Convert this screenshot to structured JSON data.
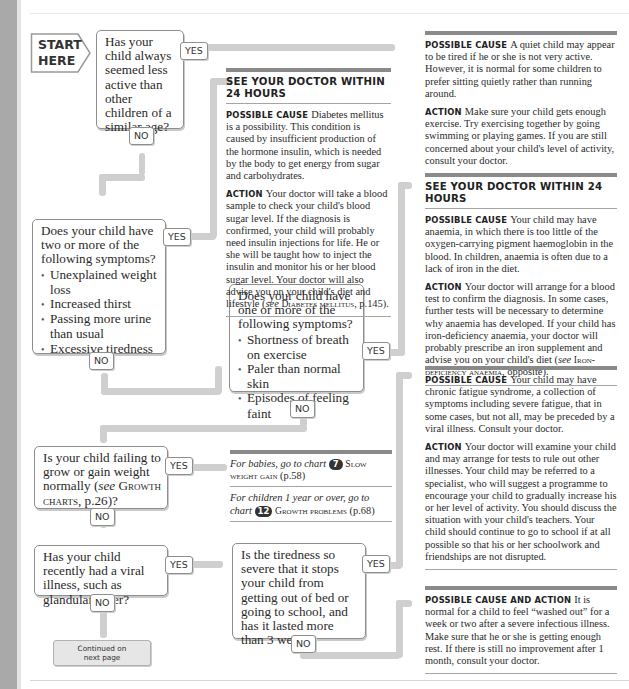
{
  "page": {
    "start_label_line1": "START",
    "start_label_line2": "HERE",
    "continued_line1": "Continued on",
    "continued_line2": "next page"
  },
  "questions": {
    "q1": {
      "text": "Has your child always seemed less active than other children of a similar age?",
      "yes": "YES",
      "no": "NO"
    },
    "q2": {
      "text": "Does your child have two or more of the following symptoms?",
      "bullets": [
        "Unexplained weight loss",
        "Increased thirst",
        "Passing more urine than usual",
        "Excessive tiredness"
      ],
      "yes": "YES",
      "no": "NO"
    },
    "q3": {
      "text": "Does your child have one or more of the following symptoms?",
      "bullets": [
        "Shortness of breath on exercise",
        "Paler than normal skin",
        "Episodes of feeling faint"
      ],
      "yes": "YES",
      "no": "NO"
    },
    "q4": {
      "text_before": "Is your child failing to grow or gain weight normally (",
      "see": "see",
      "ref": "Growth charts",
      "text_after": ", p.26)?",
      "yes": "YES",
      "no": "NO"
    },
    "q5": {
      "text": "Has your child recently had a viral illness, such as glandular fever?",
      "yes": "YES",
      "no": "NO"
    },
    "q6": {
      "text": "Is the tiredness so severe that it stops your child from getting out of bed or going to school, and has it lasted more than 3 weeks?",
      "yes": "YES",
      "no": "NO"
    }
  },
  "panels": {
    "quiet": {
      "cause_label": "Possible cause",
      "cause": "A quiet child may appear to be tired if he or she is not very active. However, it is normal for some children to prefer sitting quietly rather than running around.",
      "action_label": "Action",
      "action": "Make sure your child gets enough exercise. Try exercising together by going swimming or playing games. If you are still concerned about your child's level of activity, consult your doctor."
    },
    "diabetes": {
      "heading": "SEE YOUR DOCTOR WITHIN 24 HOURS",
      "cause_label": "Possible cause",
      "cause": "Diabetes mellitus is a possibility. This condition is caused by insufficient production of the hormone insulin, which is needed by the body to get energy from sugar and carbohydrates.",
      "action_label": "Action",
      "action": "Your doctor will take a blood sample to check your child's blood sugar level. If the diagnosis is confirmed, your child will probably need insulin injections for life. He or she will be taught how to inject the insulin and monitor his or her blood sugar level. Your doctor will also advise you on your child's diet and lifestyle (",
      "action_see": "see",
      "action_ref": "Diabetes mellitus",
      "action_end": ", p.145)."
    },
    "anaemia": {
      "heading": "SEE YOUR DOCTOR WITHIN 24 HOURS",
      "cause_label": "Possible cause",
      "cause": "Your child may have anaemia, in which there is too little of the oxygen-carrying pigment haemoglobin in the blood. In children, anaemia is often due to a lack of iron in the diet.",
      "action_label": "Action",
      "action": "Your doctor will arrange for a blood test to confirm the diagnosis. In some cases, further tests will be necessary to determine why anaemia has developed. If your child has iron-deficiency anaemia, your doctor will probably prescribe an iron supplement and advise you on your child's diet (",
      "action_see": "see",
      "action_ref": "Iron-deficiency anaemia",
      "action_end": ", opposite)."
    },
    "growth": {
      "line1_italic": "For babies, go to chart",
      "line1_badge": "7",
      "line1_ref": "Slow weight gain",
      "line1_page": "(p.58)",
      "line2_italic": "For children 1 year or over, go to chart",
      "line2_badge": "12",
      "line2_ref": "Growth problems",
      "line2_page": "(p.68)"
    },
    "cfs": {
      "cause_label": "Possible cause",
      "cause": "Your child may have chronic fatigue syndrome, a collection of symptoms including severe fatigue, that in some cases, but not all, may be preceded by a viral illness. Consult your doctor.",
      "action_label": "Action",
      "action": "Your doctor will examine your child and may arrange for tests to rule out other illnesses. Your child may be referred to a specialist, who will suggest a programme to encourage your child to gradually increase his or her level of activity. You should discuss the situation with your child's teachers. Your child should continue to go to school if at all possible so that his or her schoolwork and friendships are not disrupted."
    },
    "washed_out": {
      "label": "Possible cause and action",
      "text": "It is normal for a child to feel “washed out” for a week or two after a severe infectious illness. Make sure that he or she is getting enough rest. If there is still no improvement after 1 month, consult your doctor."
    }
  },
  "colors": {
    "connector": "#cfcfcf",
    "box_border": "#8e8e8e",
    "panel_bar": "#8a8a8a",
    "side_band": "#a9a9a9",
    "continued_fill": "#e6e6e6"
  }
}
